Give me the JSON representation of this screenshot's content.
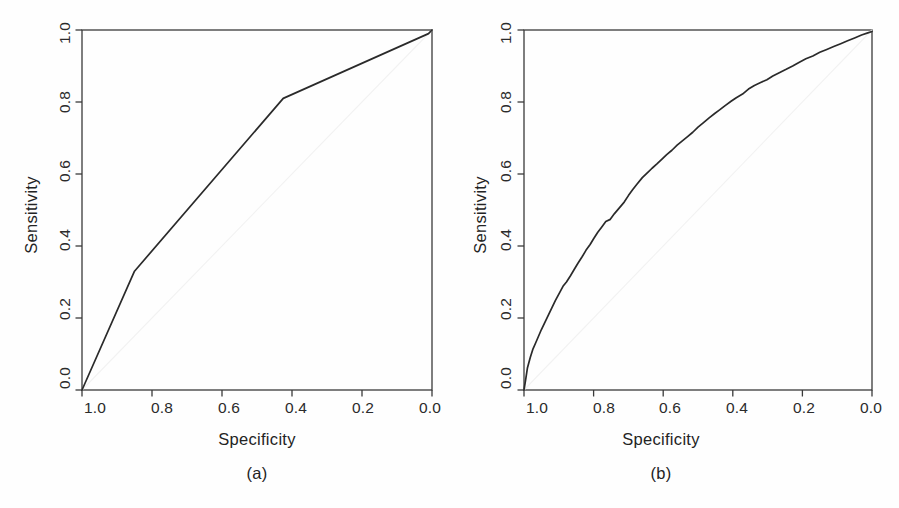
{
  "figure": {
    "background_color": "#fefefe",
    "line_color": "#2a2a2a",
    "axis_color": "#3a3a3a",
    "diagonal_color": "#f2f2f2"
  },
  "chart_data": [
    {
      "type": "line",
      "panel_id": "a",
      "caption": "(a)",
      "title": "",
      "xlabel": "Specificity",
      "ylabel": "Sensitivity",
      "xlim": [
        1.0,
        0.0
      ],
      "ylim": [
        0.0,
        1.0
      ],
      "x_reversed": true,
      "grid": false,
      "legend": "none",
      "xticks": [
        "1.0",
        "0.8",
        "0.6",
        "0.4",
        "0.2",
        "0.0"
      ],
      "xtick_values": [
        1.0,
        0.8,
        0.6,
        0.4,
        0.2,
        0.0
      ],
      "yticks": [
        "0.0",
        "0.2",
        "0.4",
        "0.6",
        "0.8",
        "1.0"
      ],
      "ytick_values": [
        0.0,
        0.2,
        0.4,
        0.6,
        0.8,
        1.0
      ],
      "series": [
        {
          "name": "ROC curve (a)",
          "specificity": [
            1.0,
            0.85,
            0.425,
            0.01,
            0.0
          ],
          "sensitivity": [
            0.0,
            0.33,
            0.81,
            0.99,
            1.0
          ]
        },
        {
          "name": "chance diagonal",
          "specificity": [
            1.0,
            0.0
          ],
          "sensitivity": [
            0.0,
            1.0
          ]
        }
      ]
    },
    {
      "type": "line",
      "panel_id": "b",
      "caption": "(b)",
      "title": "",
      "xlabel": "Specificity",
      "ylabel": "Sensitivity",
      "xlim": [
        1.0,
        0.0
      ],
      "ylim": [
        0.0,
        1.0
      ],
      "x_reversed": true,
      "grid": false,
      "legend": "none",
      "xticks": [
        "1.0",
        "0.8",
        "0.6",
        "0.4",
        "0.2",
        "0.0"
      ],
      "xtick_values": [
        1.0,
        0.8,
        0.6,
        0.4,
        0.2,
        0.0
      ],
      "yticks": [
        "0.0",
        "0.2",
        "0.4",
        "0.6",
        "0.8",
        "1.0"
      ],
      "ytick_values": [
        0.0,
        0.2,
        0.4,
        0.6,
        0.8,
        1.0
      ],
      "series": [
        {
          "name": "ROC curve (b)",
          "specificity": [
            1.0,
            0.995,
            0.99,
            0.982,
            0.975,
            0.966,
            0.958,
            0.95,
            0.94,
            0.93,
            0.92,
            0.91,
            0.898,
            0.888,
            0.878,
            0.866,
            0.855,
            0.845,
            0.833,
            0.822,
            0.81,
            0.8,
            0.788,
            0.777,
            0.765,
            0.752,
            0.74,
            0.726,
            0.712,
            0.7,
            0.688,
            0.675,
            0.66,
            0.645,
            0.632,
            0.618,
            0.605,
            0.59,
            0.575,
            0.56,
            0.545,
            0.53,
            0.515,
            0.5,
            0.485,
            0.468,
            0.452,
            0.438,
            0.422,
            0.405,
            0.39,
            0.372,
            0.355,
            0.338,
            0.32,
            0.302,
            0.285,
            0.265,
            0.248,
            0.228,
            0.21,
            0.19,
            0.17,
            0.15,
            0.13,
            0.11,
            0.09,
            0.07,
            0.05,
            0.03,
            0.012,
            0.0
          ],
          "sensitivity": [
            0.0,
            0.03,
            0.062,
            0.09,
            0.112,
            0.132,
            0.15,
            0.168,
            0.188,
            0.208,
            0.228,
            0.248,
            0.27,
            0.288,
            0.3,
            0.318,
            0.336,
            0.352,
            0.37,
            0.388,
            0.404,
            0.42,
            0.438,
            0.452,
            0.468,
            0.474,
            0.49,
            0.506,
            0.522,
            0.54,
            0.556,
            0.572,
            0.59,
            0.604,
            0.616,
            0.628,
            0.64,
            0.654,
            0.666,
            0.68,
            0.692,
            0.704,
            0.716,
            0.73,
            0.742,
            0.756,
            0.768,
            0.778,
            0.79,
            0.802,
            0.812,
            0.822,
            0.836,
            0.846,
            0.854,
            0.862,
            0.872,
            0.882,
            0.89,
            0.9,
            0.91,
            0.92,
            0.928,
            0.938,
            0.946,
            0.954,
            0.962,
            0.97,
            0.978,
            0.986,
            0.992,
            0.996
          ]
        },
        {
          "name": "chance diagonal",
          "specificity": [
            1.0,
            0.0
          ],
          "sensitivity": [
            0.0,
            1.0
          ]
        }
      ]
    }
  ]
}
